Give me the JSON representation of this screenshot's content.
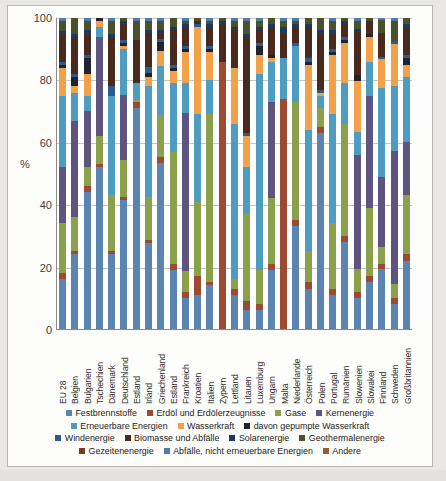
{
  "chart_data": {
    "type": "bar",
    "stacked": true,
    "stack_mode": "percent",
    "title": "",
    "subtitle": "",
    "xlabel": "",
    "ylabel": "%",
    "ylim": [
      0,
      100
    ],
    "yticks": [
      0,
      20,
      40,
      60,
      80,
      100
    ],
    "grid": true,
    "legend_position": "bottom",
    "categories": [
      "EU 28",
      "Belgien",
      "Bulgarien",
      "Tschechien",
      "Dänemark",
      "Deutschland",
      "Estland",
      "Irland",
      "Griechenland",
      "Estland",
      "Frankreich",
      "Kroatien",
      "Italien",
      "Zypern",
      "Lettland",
      "Litauen",
      "Luxemburg",
      "Ungarn",
      "Malta",
      "Niederlande",
      "Österreich",
      "Polen",
      "Portugal",
      "Rumänien",
      "Slowenien",
      "Slowakei",
      "Finnland",
      "Schweden",
      "Großbritannien"
    ],
    "series": [
      {
        "name": "Festbrennstoffe",
        "color": "#5b84b1",
        "values": [
          16,
          24,
          44,
          52,
          24,
          42,
          71,
          28,
          55,
          19,
          10,
          11,
          14,
          0,
          11,
          6,
          6,
          19,
          0,
          33,
          13,
          63,
          11,
          28,
          11,
          15,
          25,
          9,
          22
        ]
      },
      {
        "name": "Erdöl und Erdölerzeugnisse",
        "color": "#9c4a31",
        "values": [
          2,
          1,
          2,
          1,
          1,
          1,
          2,
          1,
          2,
          2,
          2,
          6,
          1,
          84,
          2,
          3,
          2,
          2,
          74,
          2,
          2,
          2,
          2,
          2,
          2,
          2,
          2,
          2,
          2
        ]
      },
      {
        "name": "Gase",
        "color": "#8aa04a",
        "values": [
          16,
          11,
          6,
          9,
          18,
          12,
          1,
          14,
          14,
          36,
          7,
          24,
          54,
          0,
          3,
          28,
          11,
          21,
          0,
          38,
          10,
          6,
          21,
          36,
          8,
          22,
          7,
          5,
          19
        ]
      },
      {
        "name": "Kernenergie",
        "color": "#5d5480",
        "values": [
          18,
          31,
          18,
          32,
          0,
          21,
          0,
          0,
          0,
          0,
          51,
          0,
          0,
          0,
          0,
          0,
          0,
          31,
          0,
          0,
          0,
          0,
          0,
          0,
          40,
          36,
          29,
          47,
          17
        ]
      },
      {
        "name": "Erneuerbare Energien",
        "color": "#4e9dc0",
        "values": [
          23,
          9,
          5,
          3,
          32,
          15,
          5,
          36,
          16,
          22,
          10,
          28,
          11,
          0,
          50,
          15,
          63,
          13,
          13,
          18,
          39,
          4,
          35,
          13,
          8,
          11,
          37,
          23,
          21
        ]
      },
      {
        "name": "Wasserkraft",
        "color": "#f2a148",
        "values": [
          9,
          2,
          7,
          2,
          0,
          1,
          0,
          3,
          5,
          4,
          10,
          28,
          9,
          0,
          18,
          10,
          6,
          1,
          0,
          0,
          21,
          1,
          19,
          13,
          18,
          8,
          12,
          15,
          4
        ]
      },
      {
        "name": "davon gepumpte Wasserkraft",
        "color": "#1f2430",
        "values": [
          1,
          3,
          5,
          1,
          0,
          1,
          0,
          1,
          3,
          1,
          1,
          0,
          1,
          0,
          0,
          0,
          3,
          1,
          0,
          0,
          1,
          0,
          1,
          1,
          2,
          1,
          0,
          0,
          2
        ]
      },
      {
        "name": "Windenergie",
        "color": "#2e5a8a",
        "values": [
          1,
          1,
          1,
          0,
          3,
          1,
          0,
          2,
          1,
          1,
          1,
          1,
          1,
          0,
          0,
          1,
          1,
          0,
          0,
          1,
          1,
          1,
          1,
          1,
          0,
          0,
          1,
          1,
          1
        ]
      },
      {
        "name": "Biomasse und Abfälle",
        "color": "#4a2a1c",
        "values": [
          9,
          12,
          7,
          0,
          16,
          5,
          14,
          11,
          2,
          11,
          6,
          1,
          6,
          12,
          12,
          31,
          4,
          9,
          8,
          5,
          10,
          18,
          5,
          4,
          15,
          4,
          10,
          0,
          9
        ]
      },
      {
        "name": "Solarenergie",
        "color": "#1b3a63",
        "values": [
          1,
          1,
          1,
          0,
          1,
          1,
          0,
          1,
          1,
          1,
          1,
          0,
          1,
          1,
          1,
          1,
          1,
          1,
          2,
          1,
          1,
          1,
          1,
          1,
          1,
          0,
          0,
          0,
          1
        ]
      },
      {
        "name": "Geothermalenergie",
        "color": "#48532c",
        "values": [
          3,
          5,
          3,
          0,
          4,
          1,
          6,
          3,
          3,
          3,
          1,
          1,
          1,
          1,
          2,
          4,
          2,
          2,
          2,
          1,
          2,
          4,
          3,
          1,
          3,
          1,
          5,
          7,
          2
        ]
      },
      {
        "name": "Gezeitenenergie",
        "color": "#7a3a22",
        "values": [
          0,
          0,
          0,
          0,
          0,
          0,
          0,
          0,
          0,
          0,
          0,
          0,
          0,
          0,
          0,
          0,
          0,
          0,
          0,
          0,
          0,
          0,
          0,
          0,
          0,
          0,
          0,
          0,
          0
        ]
      },
      {
        "name": "Abfälle, nicht erneuerbare Energien",
        "color": "#4f7ca8",
        "values": [
          1,
          0,
          1,
          0,
          1,
          0,
          1,
          1,
          1,
          0,
          1,
          0,
          1,
          0,
          1,
          1,
          1,
          0,
          1,
          1,
          0,
          0,
          1,
          0,
          1,
          0,
          1,
          1,
          0
        ]
      },
      {
        "name": "Andere",
        "color": "#a05a32",
        "values": [
          0,
          0,
          0,
          0,
          0,
          0,
          0,
          0,
          0,
          0,
          0,
          0,
          0,
          0,
          0,
          0,
          0,
          0,
          0,
          0,
          0,
          0,
          0,
          0,
          0,
          0,
          0,
          0,
          0
        ]
      }
    ]
  },
  "axis": {
    "ylabel": "%",
    "yticks": [
      "100",
      "80",
      "60",
      "40",
      "20",
      "0"
    ]
  },
  "legend": {
    "rows": [
      [
        {
          "label": "Festbrennstoffe",
          "color": "#5b84b1"
        },
        {
          "label": "Erdöl und Erdölerzeugnisse",
          "color": "#9c4a31"
        },
        {
          "label": "Gase",
          "color": "#8aa04a"
        },
        {
          "label": "Kernenergie",
          "color": "#5d5480"
        }
      ],
      [
        {
          "label": "Erneuerbare Energien",
          "color": "#4e9dc0"
        },
        {
          "label": "Wasserkraft",
          "color": "#f2a148"
        },
        {
          "label": "davon gepumpte Wasserkraft",
          "color": "#1f2430"
        }
      ],
      [
        {
          "label": "Windenergie",
          "color": "#2e5a8a"
        },
        {
          "label": "Biomasse und Abfälle",
          "color": "#4a2a1c"
        },
        {
          "label": "Solarenergie",
          "color": "#1b3a63"
        },
        {
          "label": "Geothermalenergie",
          "color": "#48532c"
        }
      ],
      [
        {
          "label": "Gezeitenenergie",
          "color": "#7a3a22"
        },
        {
          "label": "Abfälle, nicht erneuerbare Energien",
          "color": "#4f7ca8"
        },
        {
          "label": "Andere",
          "color": "#a05a32"
        }
      ]
    ]
  }
}
